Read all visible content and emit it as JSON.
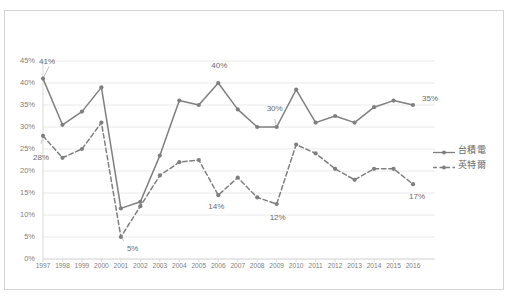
{
  "chart_data": {
    "type": "line",
    "title": "",
    "xlabel": "",
    "ylabel": "",
    "ylim": [
      0,
      45
    ],
    "ytick_labels": [
      "0%",
      "5%",
      "10%",
      "15%",
      "20%",
      "25%",
      "30%",
      "35%",
      "40%",
      "45%"
    ],
    "ytick_values": [
      0,
      5,
      10,
      15,
      20,
      25,
      30,
      35,
      40,
      45
    ],
    "grid": true,
    "legend_position": "right",
    "categories": [
      "1997",
      "1998",
      "1999",
      "2000",
      "2001",
      "2002",
      "2003",
      "2004",
      "2005",
      "2006",
      "2007",
      "2008",
      "2009",
      "2010",
      "2011",
      "2012",
      "2013",
      "2014",
      "2015",
      "2016"
    ],
    "series": [
      {
        "name": "台積電",
        "style": "solid",
        "color": "#7f7f7f",
        "values": [
          41,
          30.5,
          33.5,
          39,
          11.5,
          13,
          23.5,
          36,
          35,
          40,
          34,
          30,
          30,
          38.5,
          31,
          32.5,
          31,
          34.5,
          36,
          35
        ]
      },
      {
        "name": "英特爾",
        "style": "dashed",
        "color": "#7f7f7f",
        "values": [
          28,
          23,
          25,
          31,
          5,
          12,
          19,
          22,
          22.5,
          14.5,
          18.5,
          14,
          12.5,
          26,
          24,
          20.5,
          18,
          20.5,
          20.5,
          17
        ]
      }
    ],
    "annotations": [
      {
        "id": "a-41",
        "text": "41%",
        "series": "台積電",
        "category": "1997",
        "value": 41,
        "leader": true
      },
      {
        "id": "a-28",
        "text": "28%",
        "series": "英特爾",
        "category": "1997",
        "value": 28,
        "leader": true
      },
      {
        "id": "a-5",
        "text": "5%",
        "series": "英特爾",
        "category": "2001",
        "value": 5,
        "leader": true
      },
      {
        "id": "a-40",
        "text": "40%",
        "series": "台積電",
        "category": "2006",
        "value": 40,
        "leader": false
      },
      {
        "id": "a-14",
        "text": "14%",
        "series": "英特爾",
        "category": "2006",
        "value": 14.5,
        "leader": false
      },
      {
        "id": "a-30",
        "text": "30%",
        "series": "台積電",
        "category": "2009",
        "value": 30,
        "leader": true
      },
      {
        "id": "a-12",
        "text": "12%",
        "series": "英特爾",
        "category": "2009",
        "value": 12.5,
        "leader": false
      },
      {
        "id": "a-35",
        "text": "35%",
        "series": "台積電",
        "category": "2016",
        "value": 35,
        "leader": false
      },
      {
        "id": "a-17",
        "text": "17%",
        "series": "英特爾",
        "category": "2016",
        "value": 17,
        "leader": false
      }
    ]
  },
  "legend": {
    "items": [
      {
        "label": "台積電",
        "style": "solid"
      },
      {
        "label": "英特爾",
        "style": "dashed"
      }
    ]
  },
  "colors": {
    "line": "#7f7f7f",
    "grid": "#eaeaea",
    "axis": "#d9d9d9",
    "text": "#808080",
    "border": "#d4d4d4"
  }
}
